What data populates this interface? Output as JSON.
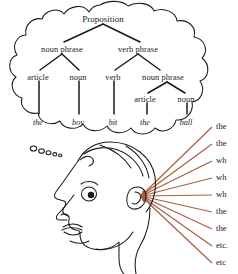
{
  "figure": {
    "kind": "illustration",
    "ink_color": "#1a1a1a",
    "ray_color": "#A9603F"
  },
  "thought_bubble": {
    "name": "thought-bubble",
    "tail_circles": 5
  },
  "parse_tree": {
    "root": {
      "label": "Proposition",
      "x": 103,
      "y": 19
    },
    "level2": [
      {
        "label": "noun phrase",
        "x": 62,
        "y": 49
      },
      {
        "label": "verb phrase",
        "x": 138,
        "y": 49
      }
    ],
    "level3": [
      {
        "label": "article",
        "x": 38,
        "y": 77
      },
      {
        "label": "noun",
        "x": 78,
        "y": 77
      },
      {
        "label": "verb",
        "x": 113,
        "y": 77
      },
      {
        "label": "noun phrase",
        "x": 163,
        "y": 77
      }
    ],
    "level4": [
      {
        "label": "article",
        "x": 145,
        "y": 99
      },
      {
        "label": "noun",
        "x": 186,
        "y": 99
      }
    ],
    "leaves": [
      {
        "label": "the",
        "x": 38,
        "y": 122
      },
      {
        "label": "boy",
        "x": 78,
        "y": 122
      },
      {
        "label": "hit",
        "x": 113,
        "y": 122
      },
      {
        "label": "the",
        "x": 145,
        "y": 122
      },
      {
        "label": "ball",
        "x": 186,
        "y": 122
      }
    ]
  },
  "head": {
    "name": "head-profile",
    "facing": "left",
    "features": [
      "hair",
      "ear",
      "eye",
      "nose",
      "mouth",
      "chin",
      "neck"
    ]
  },
  "input_rays": {
    "origin": {
      "x": 141,
      "y": 196
    },
    "items": [
      {
        "label": "the",
        "y": 126
      },
      {
        "label": "the",
        "y": 143
      },
      {
        "label": "wh",
        "y": 160
      },
      {
        "label": "wh",
        "y": 177
      },
      {
        "label": "wh",
        "y": 194
      },
      {
        "label": "the",
        "y": 211
      },
      {
        "label": "the",
        "y": 228
      },
      {
        "label": "etc.",
        "y": 245
      },
      {
        "label": "etc",
        "y": 262
      }
    ]
  }
}
